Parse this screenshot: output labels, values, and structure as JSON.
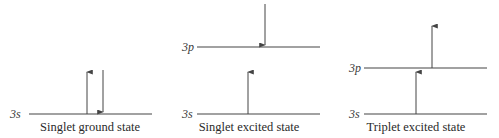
{
  "diagram": {
    "type": "electron-spin-energy-levels",
    "panels": [
      {
        "caption": "Singlet ground state",
        "levels": [
          {
            "label": "3s",
            "electrons": [
              "up",
              "down"
            ]
          }
        ]
      },
      {
        "caption": "Singlet excited state",
        "levels": [
          {
            "label": "3s",
            "electrons": [
              "up"
            ]
          },
          {
            "label": "3p",
            "electrons": [
              "down"
            ]
          }
        ]
      },
      {
        "caption": "Triplet excited state",
        "levels": [
          {
            "label": "3s",
            "electrons": [
              "up"
            ]
          },
          {
            "label": "3p",
            "electrons": [
              "up"
            ]
          }
        ]
      }
    ],
    "colors": {
      "line": "#444444",
      "text": "#2a2a2a"
    }
  }
}
